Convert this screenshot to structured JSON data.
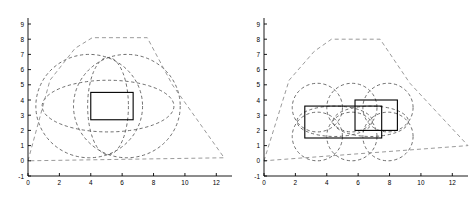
{
  "figure": {
    "title": "",
    "background_color": "#ffffff",
    "axis_color": "#000000",
    "dash_color": "#555555",
    "rect_color": "#000000",
    "hull_color": "#888888",
    "panel_count": 2
  },
  "chart_data": [
    {
      "type": "scatter",
      "title": "",
      "xlabel": "",
      "ylabel": "",
      "xlim": [
        0,
        13
      ],
      "ylim": [
        -1,
        9
      ],
      "xticks": [
        0,
        2,
        4,
        6,
        8,
        10,
        12
      ],
      "yticks": [
        -1,
        0,
        1,
        2,
        3,
        4,
        5,
        6,
        7,
        8,
        9
      ],
      "xticklabels": [
        "0",
        "2",
        "4",
        "6",
        "8",
        "10",
        "12"
      ],
      "yticklabels": [
        "-1",
        "0",
        "1",
        "2",
        "3",
        "4",
        "5",
        "6",
        "7",
        "8",
        "9"
      ],
      "grid": false,
      "legend": null,
      "series": [
        {
          "name": "circles",
          "style": "dashed",
          "shapes": [
            {
              "shape": "circle",
              "cx": 3.9,
              "cy": 3.6,
              "r": 3.4
            },
            {
              "shape": "circle",
              "cx": 6.3,
              "cy": 3.6,
              "r": 3.4
            },
            {
              "shape": "ellipse",
              "cx": 5.1,
              "cy": 3.6,
              "rx": 4.2,
              "ry": 1.7
            },
            {
              "shape": "ellipse",
              "cx": 5.1,
              "cy": 3.6,
              "rx": 1.3,
              "ry": 3.2
            }
          ]
        },
        {
          "name": "hull",
          "style": "dashed",
          "points": [
            [
              0,
              0
            ],
            [
              1.4,
              5.3
            ],
            [
              3.0,
              7.4
            ],
            [
              4.1,
              8.1
            ],
            [
              7.6,
              8.1
            ],
            [
              9.2,
              5.0
            ],
            [
              12.5,
              0.2
            ],
            [
              0,
              0
            ]
          ]
        },
        {
          "name": "rectangles",
          "style": "solid",
          "shapes": [
            {
              "shape": "rect",
              "x": 4.0,
              "y": 2.7,
              "w": 2.7,
              "h": 1.8
            }
          ]
        }
      ]
    },
    {
      "type": "scatter",
      "title": "",
      "xlabel": "",
      "ylabel": "",
      "xlim": [
        0,
        13
      ],
      "ylim": [
        -1,
        9
      ],
      "xticks": [
        0,
        2,
        4,
        6,
        8,
        10,
        12
      ],
      "yticks": [
        -1,
        0,
        1,
        2,
        3,
        4,
        5,
        6,
        7,
        8,
        9
      ],
      "xticklabels": [
        "0",
        "2",
        "4",
        "6",
        "8",
        "10",
        "12"
      ],
      "yticklabels": [
        "-1",
        "0",
        "1",
        "2",
        "3",
        "4",
        "5",
        "6",
        "7",
        "8",
        "9"
      ],
      "grid": false,
      "legend": null,
      "series": [
        {
          "name": "circles",
          "style": "dashed",
          "shapes": [
            {
              "shape": "circle",
              "cx": 3.4,
              "cy": 3.5,
              "r": 1.6
            },
            {
              "shape": "circle",
              "cx": 5.6,
              "cy": 3.5,
              "r": 1.6
            },
            {
              "shape": "circle",
              "cx": 7.9,
              "cy": 3.5,
              "r": 1.6
            },
            {
              "shape": "circle",
              "cx": 3.4,
              "cy": 1.6,
              "r": 1.6
            },
            {
              "shape": "circle",
              "cx": 5.6,
              "cy": 1.6,
              "r": 1.6
            },
            {
              "shape": "circle",
              "cx": 7.9,
              "cy": 1.6,
              "r": 1.6
            },
            {
              "shape": "ellipse",
              "cx": 4.5,
              "cy": 2.6,
              "rx": 2.4,
              "ry": 1.0
            },
            {
              "shape": "ellipse",
              "cx": 6.8,
              "cy": 2.6,
              "rx": 2.4,
              "ry": 1.0
            }
          ]
        },
        {
          "name": "hull",
          "style": "dashed",
          "points": [
            [
              0,
              0
            ],
            [
              1.6,
              5.3
            ],
            [
              3.2,
              7.2
            ],
            [
              4.3,
              8.0
            ],
            [
              7.4,
              8.0
            ],
            [
              9.3,
              5.1
            ],
            [
              13.0,
              1.0
            ],
            [
              0,
              0
            ]
          ]
        },
        {
          "name": "rectangles",
          "style": "solid",
          "shapes": [
            {
              "shape": "rect",
              "x": 2.6,
              "y": 1.5,
              "w": 4.9,
              "h": 2.1
            },
            {
              "shape": "rect",
              "x": 5.8,
              "y": 2.0,
              "w": 2.7,
              "h": 2.0
            }
          ]
        }
      ]
    }
  ],
  "watermark": {
    "text": ""
  }
}
